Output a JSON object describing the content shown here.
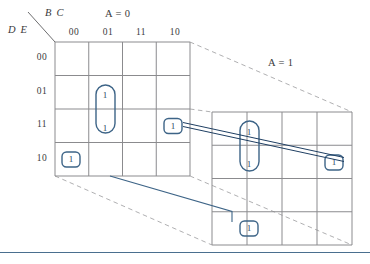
{
  "figure": {
    "name": "five-variable-karnaugh-map",
    "colors": {
      "grid": "#8b8b8e",
      "group_outline": "#3d6487",
      "link_line": "#1f3f63",
      "perspective_dash": "#b0b0b2",
      "text": "#3a3a3c",
      "one_text": "#2b4a63",
      "rule": "#4a6f8f"
    }
  },
  "axis_labels": {
    "column_vars": "B C",
    "row_vars": "D E"
  },
  "maps": [
    {
      "id": "map-a0",
      "title": "A = 0",
      "title_var": "A",
      "title_eq": "= 0",
      "column_headers": [
        "00",
        "01",
        "11",
        "10"
      ],
      "row_headers": [
        "00",
        "01",
        "11",
        "10"
      ],
      "cells": [
        [
          "",
          "",
          "",
          ""
        ],
        [
          "",
          "1",
          "",
          ""
        ],
        [
          "",
          "1",
          "",
          "1"
        ],
        [
          "1",
          "",
          "",
          ""
        ]
      ]
    },
    {
      "id": "map-a1",
      "title": "A = 1",
      "title_var": "A",
      "title_eq": "= 1",
      "column_headers": [
        "00",
        "01",
        "11",
        "10"
      ],
      "row_headers": [
        "00",
        "01",
        "11",
        "10"
      ],
      "cells": [
        [
          "",
          "",
          "",
          ""
        ],
        [
          "",
          "1",
          "",
          ""
        ],
        [
          "",
          "1",
          "",
          "1"
        ],
        [
          "1",
          "",
          "",
          ""
        ]
      ]
    }
  ],
  "ones": [
    {
      "id": "one-left-r1c1",
      "map": "map-a0",
      "row": "01",
      "col": "01",
      "value": "1"
    },
    {
      "id": "one-left-r2c1",
      "map": "map-a0",
      "row": "11",
      "col": "01",
      "value": "1"
    },
    {
      "id": "one-left-r2c3",
      "map": "map-a0",
      "row": "11",
      "col": "10",
      "value": "1"
    },
    {
      "id": "one-left-r3c0",
      "map": "map-a0",
      "row": "10",
      "col": "00",
      "value": "1"
    },
    {
      "id": "one-right-r1c1",
      "map": "map-a1",
      "row": "01",
      "col": "01",
      "value": "1"
    },
    {
      "id": "one-right-r2c1",
      "map": "map-a1",
      "row": "11",
      "col": "01",
      "value": "1"
    },
    {
      "id": "one-right-r2c3",
      "map": "map-a1",
      "row": "11",
      "col": "10",
      "value": "1"
    },
    {
      "id": "one-right-r3c0",
      "map": "map-a1",
      "row": "10",
      "col": "00",
      "value": "1"
    }
  ],
  "groups": [
    {
      "id": "group-left-vertical-pair",
      "map": "map-a0",
      "shape": "vertical-oval",
      "cells": [
        "01/01",
        "11/01"
      ]
    },
    {
      "id": "group-left-single-bc10",
      "map": "map-a0",
      "shape": "single-oval",
      "cells": [
        "11/10"
      ]
    },
    {
      "id": "group-left-single-de10",
      "map": "map-a0",
      "shape": "single-oval",
      "cells": [
        "10/00"
      ]
    },
    {
      "id": "group-right-vertical-pair",
      "map": "map-a1",
      "shape": "vertical-oval",
      "cells": [
        "01/01",
        "11/01"
      ]
    },
    {
      "id": "group-right-single-bc10",
      "map": "map-a1",
      "shape": "single-oval",
      "cells": [
        "11/10"
      ]
    },
    {
      "id": "group-right-single-de10",
      "map": "map-a1",
      "shape": "single-oval",
      "cells": [
        "10/00"
      ]
    }
  ],
  "links": [
    {
      "id": "link-bc10-pair",
      "style": "double-line",
      "from": "one-left-r2c3",
      "to": "one-right-r2c3"
    },
    {
      "id": "link-de10-pair",
      "style": "single-line",
      "from": "one-left-r3c0",
      "to": "one-right-r3c0"
    }
  ]
}
